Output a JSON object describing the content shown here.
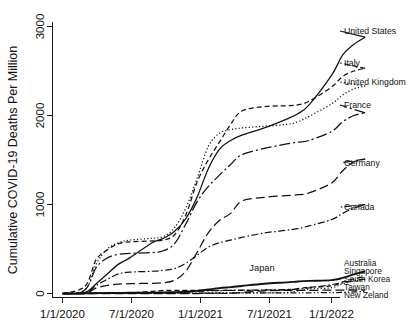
{
  "chart_data": {
    "type": "line",
    "title": "",
    "xlabel": "",
    "ylabel": "Cumulative COVID-19 Deaths Per Million",
    "ylim": [
      0,
      3000
    ],
    "yticks": [
      0,
      1000,
      2000,
      3000
    ],
    "ytick_labels": [
      "0",
      "1000",
      "2000",
      "3000"
    ],
    "xtick_labels": [
      "1/1/2020",
      "7/1/2020",
      "1/1/2021",
      "7/1/2021",
      "1/1/2022"
    ],
    "x_range": [
      "1/1/2020",
      "4/1/2022"
    ],
    "grid": false,
    "legend_position": "right-inline-labels",
    "x": [
      "1/1/2020",
      "3/1/2020",
      "4/1/2020",
      "5/1/2020",
      "6/1/2020",
      "7/1/2020",
      "9/1/2020",
      "10/1/2020",
      "11/1/2020",
      "12/1/2020",
      "1/1/2021",
      "2/1/2021",
      "3/1/2021",
      "4/1/2021",
      "5/1/2021",
      "7/1/2021",
      "9/1/2021",
      "10/1/2021",
      "11/1/2021",
      "1/1/2022",
      "2/1/2022",
      "3/1/2022",
      "4/1/2022"
    ],
    "series": [
      {
        "name": "United States",
        "line_style": "solid",
        "label": "United States",
        "values": [
          0,
          10,
          110,
          220,
          330,
          400,
          570,
          620,
          700,
          840,
          1080,
          1400,
          1620,
          1720,
          1780,
          1860,
          1960,
          2020,
          2120,
          2450,
          2680,
          2800,
          2880
        ]
      },
      {
        "name": "Italy",
        "line_style": "dashed",
        "label": "Italy",
        "values": [
          0,
          80,
          380,
          490,
          560,
          580,
          590,
          600,
          660,
          880,
          1250,
          1500,
          1700,
          1900,
          2050,
          2100,
          2110,
          2120,
          2160,
          2320,
          2440,
          2500,
          2530
        ]
      },
      {
        "name": "United Kingdom",
        "line_style": "dotted",
        "label": "United Kingdom",
        "values": [
          0,
          40,
          330,
          500,
          570,
          600,
          620,
          640,
          740,
          960,
          1290,
          1650,
          1800,
          1840,
          1860,
          1880,
          1900,
          1930,
          1990,
          2130,
          2230,
          2300,
          2330
        ]
      },
      {
        "name": "France",
        "line_style": "dashdot-long",
        "label": "France",
        "values": [
          0,
          40,
          290,
          400,
          440,
          450,
          460,
          480,
          560,
          780,
          1030,
          1200,
          1330,
          1450,
          1560,
          1630,
          1680,
          1700,
          1720,
          1820,
          1930,
          2000,
          2030
        ]
      },
      {
        "name": "Germany",
        "line_style": "long-dash",
        "label": "Germany",
        "values": [
          0,
          5,
          60,
          90,
          105,
          110,
          115,
          120,
          150,
          250,
          460,
          680,
          820,
          900,
          1040,
          1080,
          1100,
          1110,
          1130,
          1240,
          1380,
          1480,
          1510
        ]
      },
      {
        "name": "Canada",
        "line_style": "dashdot",
        "label": "Canada",
        "values": [
          0,
          10,
          90,
          160,
          220,
          240,
          250,
          260,
          280,
          340,
          430,
          520,
          570,
          600,
          630,
          680,
          710,
          730,
          760,
          830,
          900,
          960,
          1000
        ]
      },
      {
        "name": "Japan",
        "line_style": "solid-thick",
        "label": "Japan",
        "values": [
          0,
          1,
          4,
          5,
          7,
          8,
          10,
          12,
          15,
          20,
          30,
          45,
          60,
          72,
          85,
          110,
          125,
          135,
          142,
          150,
          175,
          215,
          250
        ]
      },
      {
        "name": "Australia",
        "line_style": "dashed",
        "label": "Australia",
        "values": [
          0,
          0,
          3,
          4,
          4,
          5,
          25,
          34,
          35,
          35,
          36,
          36,
          36,
          36,
          36,
          37,
          42,
          55,
          70,
          85,
          130,
          165,
          190
        ]
      },
      {
        "name": "Singapore",
        "line_style": "dotted",
        "label": "Singapore",
        "values": [
          0,
          0,
          2,
          4,
          4,
          5,
          5,
          5,
          5,
          5,
          5,
          6,
          6,
          6,
          6,
          7,
          12,
          30,
          50,
          65,
          110,
          140,
          160
        ]
      },
      {
        "name": "South Korea",
        "line_style": "dashdot",
        "label": "South Korea",
        "values": [
          0,
          2,
          5,
          5,
          5,
          6,
          7,
          8,
          10,
          13,
          23,
          30,
          33,
          35,
          37,
          40,
          45,
          50,
          62,
          100,
          120,
          145,
          160
        ]
      },
      {
        "name": "Taiwan",
        "line_style": "long-dash",
        "label": "Taiwan",
        "values": [
          0,
          0,
          0,
          0,
          0,
          0,
          0,
          0,
          0,
          0,
          0,
          1,
          1,
          2,
          12,
          30,
          35,
          36,
          36,
          37,
          37,
          38,
          38
        ]
      },
      {
        "name": "New Zeland",
        "line_style": "dashdotdot",
        "label": "New Zeland",
        "values": [
          0,
          0,
          2,
          4,
          4,
          4,
          5,
          5,
          5,
          5,
          5,
          5,
          5,
          5,
          6,
          6,
          6,
          7,
          8,
          10,
          12,
          18,
          22
        ]
      }
    ],
    "inline_annotations": [
      {
        "text": "Japan",
        "x_ref": "10/1/2021",
        "y_ref": 330
      }
    ]
  },
  "colors": {
    "ink": "#111111",
    "background": "#ffffff"
  }
}
